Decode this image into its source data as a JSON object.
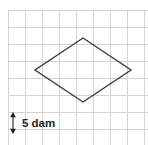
{
  "figure": {
    "background_color": "#ffffff"
  },
  "grid": {
    "line_color": "#d4d4d4",
    "cell_size": 17,
    "origin_x": 8,
    "origin_y": 10,
    "columns": 8,
    "rows": 8,
    "visible": true
  },
  "shape": {
    "name": "rhombus",
    "stroke_color": "#3a3a3a",
    "fill_color": "none",
    "stroke_width": 1.4,
    "vertices": [
      {
        "label": "top",
        "x": 83,
        "y": 38
      },
      {
        "label": "right",
        "x": 131,
        "y": 70
      },
      {
        "label": "bottom",
        "x": 83,
        "y": 102
      },
      {
        "label": "left",
        "x": 35,
        "y": 70
      }
    ],
    "diagonal_horizontal_cells": 6,
    "diagonal_vertical_cells": 4
  },
  "scale": {
    "label": "5 dam",
    "value": 5,
    "unit": "dam",
    "arrow_color": "#231f20",
    "arrow_x": 13,
    "arrow_top_y": 113,
    "arrow_bottom_y": 133,
    "label_x": 22,
    "label_y": 127
  }
}
